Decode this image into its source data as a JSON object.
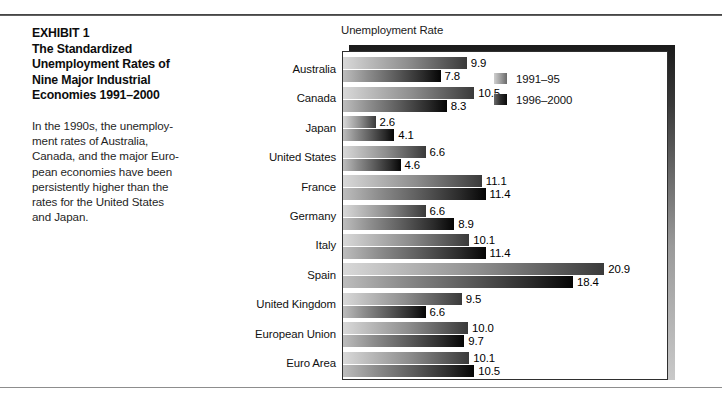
{
  "exhibit": {
    "title_lines": [
      "EXHIBIT 1",
      "The Standardized",
      "Unemployment Rates of",
      "Nine Major Industrial",
      "Economies 1991–2000"
    ],
    "body_lines": [
      "In the 1990s, the unemploy-",
      "ment rates of Australia,",
      "Canada, and the major Euro-",
      "pean economies have been",
      "persistently higher than the",
      "rates for the United States",
      "and Japan."
    ]
  },
  "chart_data": {
    "type": "bar",
    "orientation": "horizontal",
    "title": "Unemployment Rate",
    "xlabel": "",
    "ylabel": "",
    "grid": false,
    "legend_position": "top-right",
    "xlim": [
      0,
      26
    ],
    "categories": [
      "Australia",
      "Canada",
      "Japan",
      "United States",
      "France",
      "Germany",
      "Italy",
      "Spain",
      "United Kingdom",
      "European Union",
      "Euro Area"
    ],
    "series": [
      {
        "name": "1991–95",
        "color": "#8e8e8e",
        "values": [
          9.9,
          10.5,
          2.6,
          6.6,
          11.1,
          6.6,
          10.1,
          20.9,
          9.5,
          10.0,
          10.1
        ],
        "labels": [
          "9.9",
          "10.5",
          "2.6",
          "6.6",
          "11.1",
          "6.6",
          "10.1",
          "20.9",
          "9.5",
          "10.0",
          "10.1"
        ]
      },
      {
        "name": "1996–2000",
        "color": "#151515",
        "values": [
          7.8,
          8.3,
          4.1,
          4.6,
          11.4,
          8.9,
          11.4,
          18.4,
          6.6,
          9.7,
          10.5
        ],
        "labels": [
          "7.8",
          "8.3",
          "4.1",
          "4.6",
          "11.4",
          "8.9",
          "11.4",
          "18.4",
          "6.6",
          "9.7",
          "10.5"
        ]
      }
    ]
  }
}
